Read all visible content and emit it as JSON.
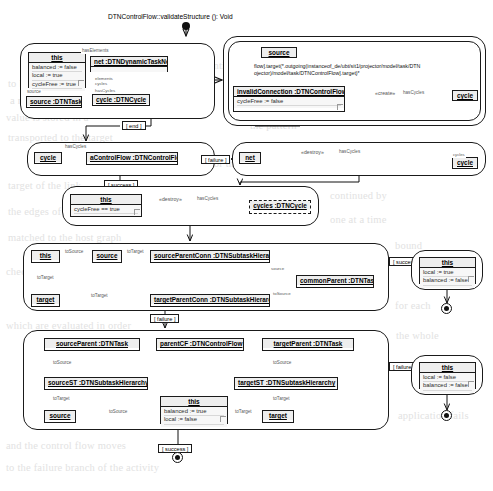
{
  "diagram": {
    "title": "DTNControlFlow::validateStructure (): Void",
    "type": "UML story diagram / activity diagram",
    "guards": {
      "failure": "[ failure ]",
      "success": "[ success ]",
      "end": "[ end ]"
    }
  },
  "ghost_text": [
    "to be considered. As such the",
    "identify those nodes that",
    "a match. So for every",
    "the rule the matching",
    "value is stored in a",
    "pattern the pattern",
    "transported to the",
    "the type of the target",
    "story pattern we need",
    "for the source and",
    "target of the link.",
    "The matching process",
    "is then continued by",
    "the edges of the graph",
    "nodes of the story",
    "one element at a time",
    "matched to the host graph",
    "an element is bound",
    "checking the constraints",
    "expression for each",
    "which are evaluated",
    "in a certain order",
    "failure then the whole",
    "rule application fails",
    "and the control flow",
    "moves to the failure",
    "branch of the activity"
  ],
  "panels": [
    {
      "name": "panel-1-left",
      "x": 20,
      "y": 43,
      "w": 195,
      "h": 76
    },
    {
      "name": "panel-1-right",
      "x": 223,
      "y": 36,
      "w": 263,
      "h": 90
    },
    {
      "name": "panel-2-left",
      "x": 27,
      "y": 142,
      "w": 188,
      "h": 34
    },
    {
      "name": "panel-2-right",
      "x": 232,
      "y": 142,
      "w": 254,
      "h": 34
    },
    {
      "name": "panel-3",
      "x": 62,
      "y": 186,
      "w": 257,
      "h": 40
    },
    {
      "name": "panel-4",
      "x": 23,
      "y": 243,
      "w": 366,
      "h": 68
    },
    {
      "name": "panel-4-result",
      "x": 411,
      "y": 250,
      "w": 72,
      "h": 40
    },
    {
      "name": "panel-5",
      "x": 23,
      "y": 330,
      "w": 366,
      "h": 100
    },
    {
      "name": "panel-5-result",
      "x": 411,
      "y": 355,
      "w": 72,
      "h": 40
    }
  ],
  "objects": {
    "p1_this": {
      "title": "this",
      "attrs": [
        "balanced := false",
        "local := true",
        "cycleFree := true"
      ]
    },
    "p1_source": {
      "title": "source :DTNTask",
      "attrs": []
    },
    "p1_net": {
      "title": "net :DTNDynamicTaskNet",
      "attrs": []
    },
    "p1_cycle": {
      "title": "cycle :DTNCycle",
      "attrs": []
    },
    "p1r_source": {
      "title": "source",
      "attrs": []
    },
    "p1r_invalid": {
      "title": "invalidConnection :DTNControlFlow",
      "attrs": [
        "cycleFree := false"
      ]
    },
    "p1r_cycle": {
      "title": "cycle",
      "attrs": []
    },
    "p2_cycle": {
      "title": "cycle",
      "attrs": []
    },
    "p2_acf": {
      "title": "aControlFlow :DTNControlFlow",
      "attrs": []
    },
    "p2r_net": {
      "title": "net",
      "attrs": []
    },
    "p2r_cycle": {
      "title": "cycle",
      "attrs": []
    },
    "p3_this": {
      "title": "this",
      "attrs": [
        "cycleFree == true"
      ]
    },
    "p3_cycles": {
      "title": "cycles :DTNCycle",
      "attrs": []
    },
    "p4_this": {
      "title": "this",
      "attrs": []
    },
    "p4_source": {
      "title": "source",
      "attrs": []
    },
    "p4_target": {
      "title": "target",
      "attrs": []
    },
    "p4_spc": {
      "title": "sourceParentConn :DTNSubtaskHierarchy",
      "attrs": []
    },
    "p4_tpc": {
      "title": "targetParentConn :DTNSubtaskHierarchy",
      "attrs": []
    },
    "p4_cp": {
      "title": "commonParent :DTNTask",
      "attrs": []
    },
    "p4_res_this": {
      "title": "this",
      "attrs": [
        "local := true",
        "balanced := false"
      ]
    },
    "p5_sp": {
      "title": "sourceParent :DTNTask",
      "attrs": []
    },
    "p5_pcf": {
      "title": "parentCF :DTNControlFlow",
      "attrs": []
    },
    "p5_tp": {
      "title": "targetParent :DTNTask",
      "attrs": []
    },
    "p5_sst": {
      "title": "sourceST :DTNSubtaskHierarchy",
      "attrs": []
    },
    "p5_tst": {
      "title": "targetST :DTNSubtaskHierarchy",
      "attrs": []
    },
    "p5_source": {
      "title": "source",
      "attrs": []
    },
    "p5_target": {
      "title": "target",
      "attrs": []
    },
    "p5_this": {
      "title": "this",
      "attrs": [
        "balanced := true",
        "local := false"
      ]
    },
    "p5_res_this": {
      "title": "this",
      "attrs": [
        "local := false",
        "balanced := false"
      ]
    }
  },
  "link_labels": {
    "hasElements": "hasElements",
    "hasCycles": "hasCycles",
    "source": "source",
    "target": "target",
    "toSource": "toSource",
    "toTarget": "toTarget",
    "hasCycles_s": "hasCycles",
    "destroy": "«destroy»",
    "create": "«create»",
    "elements": "elements",
    "cycles": "cycles"
  },
  "ocl": {
    "constraint_line1": "flow].target(*.outgoing(instanceof_de/ubt/sit1/projector/model/task/DTN",
    "constraint_line2": "ojector)/model/task/DTNControlFlow].target)*"
  }
}
